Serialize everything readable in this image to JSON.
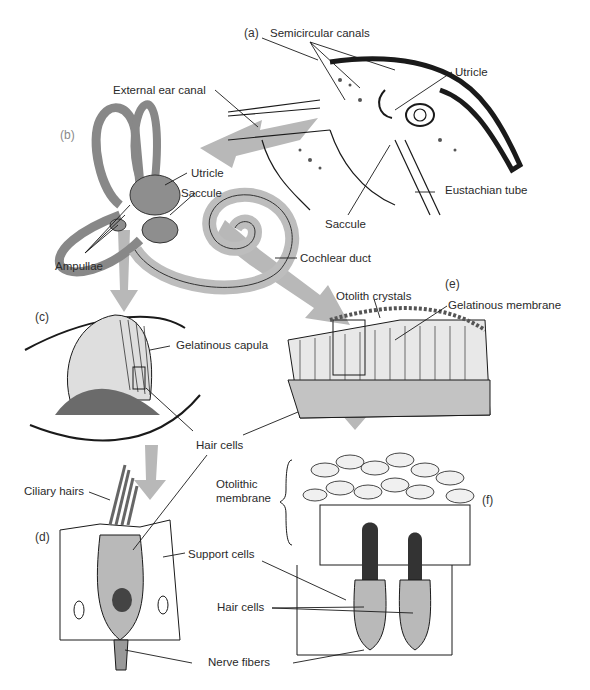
{
  "panels": {
    "a": "(a)",
    "b": "(b)",
    "c": "(c)",
    "d": "(d)",
    "e": "(e)",
    "f": "(f)"
  },
  "labels": {
    "semicircular_canals": "Semicircular canals",
    "utricle_a": "Utricle",
    "external_ear_canal": "External ear canal",
    "eustachian_tube": "Eustachian tube",
    "saccule_a": "Saccule",
    "utricle_b": "Utricle",
    "saccule_b": "Saccule",
    "ampullae": "Ampullae",
    "cochlear_duct": "Cochlear duct",
    "otolith_crystals": "Otolith crystals",
    "gelatinous_membrane": "Gelatinous membrane",
    "gelatinous_capula": "Gelatinous capula",
    "hair_cells_top": "Hair cells",
    "ciliary_hairs": "Ciliary hairs",
    "otolithic_membrane_1": "Otolithic",
    "otolithic_membrane_2": "membrane",
    "support_cells": "Support cells",
    "hair_cells_bottom": "Hair cells",
    "nerve_fibers": "Nerve fibers"
  },
  "colors": {
    "arrow": "#b8b8b8",
    "ink": "#1a1a1a",
    "tissue": "#c9c9c9"
  }
}
